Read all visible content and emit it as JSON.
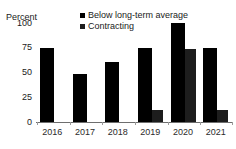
{
  "title_fragment": "",
  "axis": {
    "ylabel": "Percent",
    "yticks": [
      "100",
      "75",
      "50",
      "25",
      "0"
    ],
    "xticks": [
      "2016",
      "2017",
      "2018",
      "2019",
      "2020",
      "2021"
    ]
  },
  "legend": {
    "items": [
      {
        "label": "Below long-term average",
        "color": "#000000"
      },
      {
        "label": "Contracting",
        "color": "#1d1d1d"
      }
    ]
  },
  "chart_data": {
    "type": "bar",
    "title": "",
    "xlabel": "",
    "ylabel": "Percent",
    "ylim": [
      0,
      100
    ],
    "yticks": [
      0,
      25,
      50,
      75,
      100
    ],
    "grid": false,
    "legend_position": "top-right",
    "categories": [
      "2016",
      "2017",
      "2018",
      "2019",
      "2020",
      "2021"
    ],
    "series": [
      {
        "name": "Below long-term average",
        "color": "#000000",
        "values": [
          75,
          49,
          61,
          75,
          100,
          75
        ]
      },
      {
        "name": "Contracting",
        "color": "#1d1d1d",
        "values": [
          null,
          null,
          null,
          12,
          74,
          12
        ]
      }
    ]
  }
}
